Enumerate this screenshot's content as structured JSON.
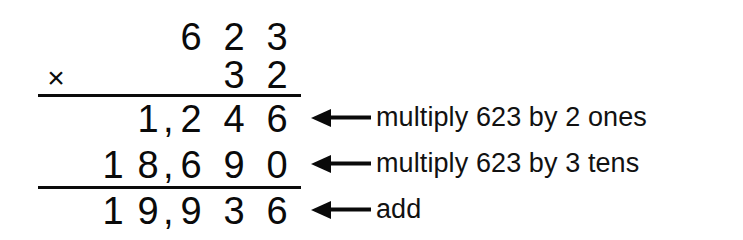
{
  "problem": {
    "multiplicand": "623",
    "multiplier": "32",
    "operator_symbol": "×",
    "product": "19,936"
  },
  "rows": {
    "multiplicand": {
      "d_thousands": "",
      "d_tenthousands": "",
      "d_hundreds": "6",
      "d_tens": "2",
      "d_ones": "3"
    },
    "multiplier": {
      "operator": "×",
      "d_tens": "3",
      "d_ones": "2"
    },
    "partial_one": {
      "d_thousands": "1",
      "comma": ",",
      "d_hundreds": "2",
      "d_tens": "4",
      "d_ones": "6"
    },
    "partial_two": {
      "d_tenthousands": "1",
      "d_thousands": "8",
      "comma": ",",
      "d_hundreds": "6",
      "d_tens": "9",
      "d_ones": "0"
    },
    "total": {
      "d_tenthousands": "1",
      "d_thousands": "9",
      "comma": ",",
      "d_hundreds": "9",
      "d_tens": "3",
      "d_ones": "6"
    }
  },
  "annotations": [
    {
      "label": "multiply 623 by 2 ones"
    },
    {
      "label": "multiply 623 by 3 tens"
    },
    {
      "label": "add"
    }
  ],
  "icons": {
    "arrow_left": "arrow-left-icon"
  },
  "colors": {
    "ink": "#0a0a0a",
    "paper": "#ffffff",
    "annotation_text": "#111111"
  }
}
